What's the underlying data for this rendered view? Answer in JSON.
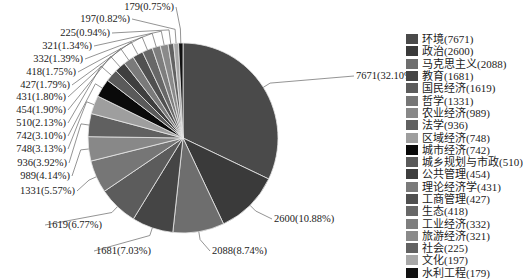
{
  "chart_data": {
    "type": "pie",
    "title": "",
    "total": 23899,
    "start_angle_deg": 0,
    "direction": "clockwise",
    "legend_position": "right",
    "categories": [
      "环境",
      "政治",
      "马克思主义",
      "教育",
      "国民经济",
      "哲学",
      "农业经济",
      "法学",
      "区域经济",
      "城市经济",
      "城乡规划与市政",
      "公共管理",
      "理论经济学",
      "工商管理",
      "生态",
      "工业经济",
      "旅游经济",
      "社会",
      "文化",
      "水利工程"
    ],
    "values": [
      7671,
      2600,
      2088,
      1681,
      1619,
      1331,
      989,
      936,
      748,
      742,
      510,
      454,
      431,
      427,
      418,
      332,
      321,
      225,
      197,
      179
    ],
    "percents": [
      "32.10%",
      "10.88%",
      "8.74%",
      "7.03%",
      "6.77%",
      "5.57%",
      "4.14%",
      "3.92%",
      "3.13%",
      "3.10%",
      "2.13%",
      "1.90%",
      "1.80%",
      "1.79%",
      "1.75%",
      "1.39%",
      "1.34%",
      "0.94%",
      "0.82%",
      "0.75%"
    ],
    "data_labels": [
      "7671(32.10%)",
      "2600(10.88%)",
      "2088(8.74%)",
      "1681(7.03%)",
      "1619(6.77%)",
      "1331(5.57%)",
      "989(4.14%)",
      "936(3.92%)",
      "748(3.13%)",
      "742(3.10%)",
      "510(2.13%)",
      "454(1.90%)",
      "431(1.80%)",
      "427(1.79%)",
      "418(1.75%)",
      "332(1.39%)",
      "321(1.34%)",
      "225(0.94%)",
      "197(0.82%)",
      "179(0.75%)"
    ],
    "legend_entries": [
      "环境(7671)",
      "政治(2600)",
      "马克思主义(2088)",
      "教育(1681)",
      "国民经济(1619)",
      "哲学(1331)",
      "农业经济(989)",
      "法学(936)",
      "区域经济(748)",
      "城市经济(742)",
      "城乡规划与市政(510)",
      "公共管理(454)",
      "理论经济学(431)",
      "工商管理(427)",
      "生态(418)",
      "工业经济(332)",
      "旅游经济(321)",
      "社会(225)",
      "文化(197)",
      "水利工程(179)"
    ],
    "colors": [
      "#4a4a4a",
      "#3a3a3a",
      "#6e6e6e",
      "#454545",
      "#5c5c5c",
      "#767676",
      "#888888",
      "#606060",
      "#9e9e9e",
      "#0a0a0a",
      "#5a5a5a",
      "#3e3e3e",
      "#7a7a7a",
      "#505050",
      "#686868",
      "#7e7e7e",
      "#8a8a8a",
      "#626262",
      "#a8a8a8",
      "#111111"
    ],
    "label_positions": [
      {
        "x": 356,
        "y": 79,
        "anchor": "start"
      },
      {
        "x": 274,
        "y": 222,
        "anchor": "start"
      },
      {
        "x": 212,
        "y": 254,
        "anchor": "start"
      },
      {
        "x": 96,
        "y": 254,
        "anchor": "start"
      },
      {
        "x": 47,
        "y": 228,
        "anchor": "start"
      },
      {
        "x": 75,
        "y": 194,
        "anchor": "end"
      },
      {
        "x": 70,
        "y": 179,
        "anchor": "end"
      },
      {
        "x": 67,
        "y": 166,
        "anchor": "end"
      },
      {
        "x": 66,
        "y": 152,
        "anchor": "end"
      },
      {
        "x": 66,
        "y": 139,
        "anchor": "end"
      },
      {
        "x": 66,
        "y": 126,
        "anchor": "end"
      },
      {
        "x": 66,
        "y": 113,
        "anchor": "end"
      },
      {
        "x": 66,
        "y": 100,
        "anchor": "end"
      },
      {
        "x": 70,
        "y": 88,
        "anchor": "end"
      },
      {
        "x": 76,
        "y": 75,
        "anchor": "end"
      },
      {
        "x": 83,
        "y": 62,
        "anchor": "end"
      },
      {
        "x": 92,
        "y": 49,
        "anchor": "end"
      },
      {
        "x": 110,
        "y": 36,
        "anchor": "end"
      },
      {
        "x": 130,
        "y": 22,
        "anchor": "end"
      },
      {
        "x": 174,
        "y": 10,
        "anchor": "end"
      }
    ],
    "center": [
      183,
      138
    ],
    "radius": 95
  }
}
